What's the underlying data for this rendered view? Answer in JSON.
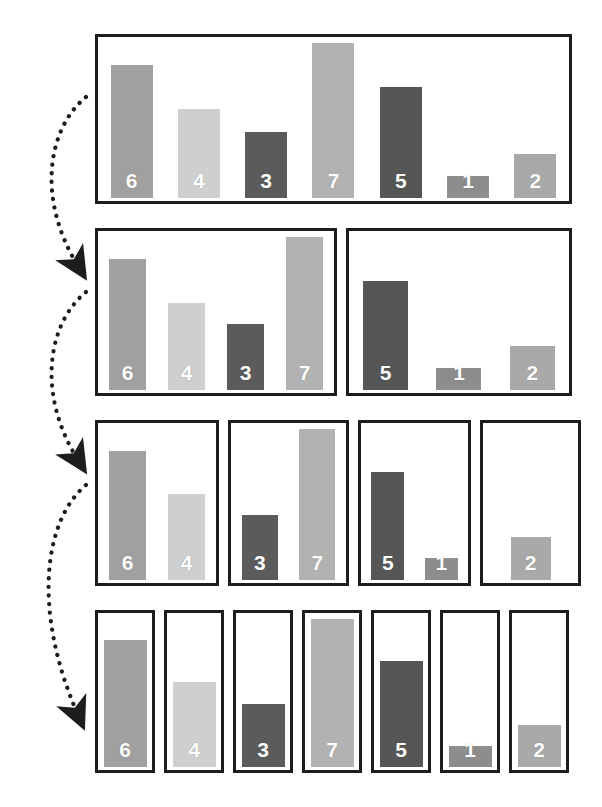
{
  "figure": {
    "background_color": "#ffffff",
    "box_border_color": "#1d1d1d",
    "label_color": "#ffffff",
    "arrow_color": "#1d1d1d"
  },
  "chart_data": {
    "type": "bar",
    "xlabel": "",
    "ylabel": "",
    "ylim": [
      0,
      7
    ],
    "grid": false,
    "legend": "none",
    "categories": [
      "6",
      "4",
      "3",
      "7",
      "5",
      "1",
      "2"
    ],
    "values": [
      6,
      4,
      3,
      7,
      5,
      1,
      2
    ],
    "bar_colors": {
      "1": "#8d8d8d",
      "2": "#a9a9a9",
      "3": "#5b5b5b",
      "4": "#cfcfcf",
      "5": "#565656",
      "6": "#a0a0a0",
      "7": "#b2b2b2"
    },
    "levels": [
      {
        "index": 0,
        "groups": [
          {
            "values": [
              6,
              4,
              3,
              7,
              5,
              1,
              2
            ]
          }
        ]
      },
      {
        "index": 1,
        "groups": [
          {
            "values": [
              6,
              4,
              3,
              7
            ]
          },
          {
            "values": [
              5,
              1,
              2
            ]
          }
        ]
      },
      {
        "index": 2,
        "groups": [
          {
            "values": [
              6,
              4
            ]
          },
          {
            "values": [
              3,
              7
            ]
          },
          {
            "values": [
              5,
              1
            ]
          },
          {
            "values": [
              2
            ]
          }
        ]
      },
      {
        "index": 3,
        "groups": [
          {
            "values": [
              6
            ]
          },
          {
            "values": [
              4
            ]
          },
          {
            "values": [
              3
            ]
          },
          {
            "values": [
              7
            ]
          },
          {
            "values": [
              5
            ]
          },
          {
            "values": [
              1
            ]
          },
          {
            "values": [
              2
            ]
          }
        ]
      }
    ]
  },
  "arrows": [
    {
      "name": "split-arrow-1",
      "style": "dotted-curved",
      "from_level": 0,
      "to_level": 1
    },
    {
      "name": "split-arrow-2",
      "style": "dotted-curved",
      "from_level": 1,
      "to_level": 2
    },
    {
      "name": "split-arrow-3",
      "style": "dotted-curved",
      "from_level": 2,
      "to_level": 3
    }
  ]
}
